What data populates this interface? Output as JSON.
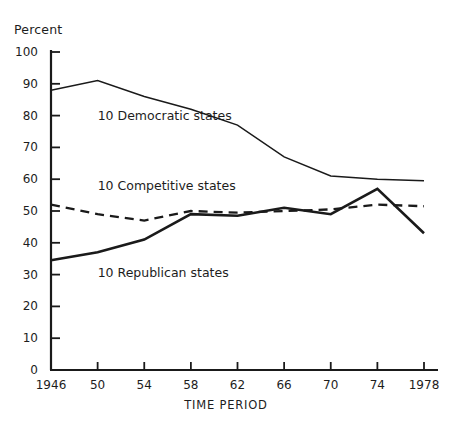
{
  "chart_data": {
    "type": "line",
    "title": "",
    "xlabel": "TIME PERIOD",
    "ylabel": "Percent",
    "grid": false,
    "legend_position": "inline-annotations",
    "x": [
      1946,
      1950,
      1954,
      1958,
      1962,
      1966,
      1970,
      1974,
      1978
    ],
    "categories": [
      "1946",
      "50",
      "54",
      "58",
      "62",
      "66",
      "70",
      "74",
      "1978"
    ],
    "xlim": [
      1946,
      1978
    ],
    "ylim": [
      0,
      100
    ],
    "ytick_labels": [
      "0",
      "10",
      "20",
      "30",
      "40",
      "50",
      "60",
      "70",
      "80",
      "90",
      "100"
    ],
    "ytick_values": [
      0,
      10,
      20,
      30,
      40,
      50,
      60,
      70,
      80,
      90,
      100
    ],
    "series": [
      {
        "name": "10 Democratic states",
        "style": "solid-thin",
        "color": "#1a1a1a",
        "values": [
          88,
          91,
          86,
          82,
          77,
          67,
          61,
          60,
          59.5
        ],
        "label_x": 1950,
        "label_y": 80
      },
      {
        "name": "10 Competitive states",
        "style": "dashed",
        "color": "#1a1a1a",
        "values": [
          52,
          49,
          47,
          50,
          49.5,
          50,
          50.5,
          52,
          51.5
        ],
        "label_x": 1950,
        "label_y": 58
      },
      {
        "name": "10 Republican states",
        "style": "solid-thick",
        "color": "#1a1a1a",
        "values": [
          34.5,
          37,
          41,
          49,
          48.5,
          51,
          49,
          57,
          43
        ],
        "label_x": 1950,
        "label_y": 30.5
      }
    ]
  },
  "axis_colors": {
    "axis_line": "#1a1a1a",
    "text": "#1d1d1d",
    "background": "#ffffff"
  }
}
